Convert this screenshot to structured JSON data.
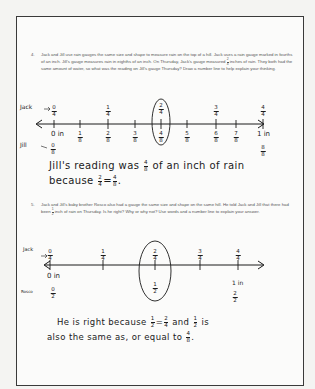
{
  "question4": {
    "number": "4.",
    "text_before_fraction": "Jack and Jill use rain gauges the same size and shape to measure rain on the top of a hill. Jack uses a rain gauge marked in fourths of an inch. Jill's gauge measures rain in eighths of an inch. On Thursday, Jack's gauge measured",
    "fraction": {
      "num": "2",
      "den": "4"
    },
    "text_after_fraction": "inches of rain. They both had the same amount of water, so what was the reading on Jill's gauge Thursday? Draw a number line to help explain your thinking.",
    "number_line": {
      "top_label": "Jack",
      "bottom_label": "Jill",
      "top_ticks": [
        {
          "num": "0",
          "den": "4"
        },
        {
          "num": "1",
          "den": "4"
        },
        {
          "num": "2",
          "den": "4"
        },
        {
          "num": "3",
          "den": "4"
        },
        {
          "num": "4",
          "den": "4"
        }
      ],
      "bottom_ticks": [
        {
          "num": "1",
          "den": "8"
        },
        {
          "num": "2",
          "den": "8"
        },
        {
          "num": "3",
          "den": "8"
        },
        {
          "num": "4",
          "den": "8"
        },
        {
          "num": "5",
          "den": "8"
        },
        {
          "num": "6",
          "den": "8"
        },
        {
          "num": "7",
          "den": "8"
        }
      ],
      "start_label": "0 in",
      "end_label": "1 in",
      "jill_start": {
        "num": "0",
        "den": "8"
      },
      "jill_end": {
        "num": "8",
        "den": "8"
      },
      "circled": "2/4 = 4/8"
    },
    "answer_line1_before": "Jill's reading was",
    "answer_fraction": {
      "num": "4",
      "den": "8"
    },
    "answer_line1_after": "of an inch of rain",
    "answer_line2_before": "because",
    "answer_eq_left": {
      "num": "2",
      "den": "4"
    },
    "answer_eq_sign": "=",
    "answer_eq_right": {
      "num": "4",
      "den": "8"
    },
    "answer_line2_end": "."
  },
  "question5": {
    "number": "5.",
    "text_before_fraction": "Jack and Jill's baby brother Rosco also had a gauge the same size and shape on the same hill. He told Jack and Jill that there had been",
    "fraction": {
      "num": "1",
      "den": "2"
    },
    "text_after_fraction": "inch of rain on Thursday. Is he right? Why or why not? Use words and a number line to explain your answer.",
    "number_line": {
      "top_label": "Jack",
      "bottom_label": "Rosco",
      "top_ticks": [
        {
          "num": "0",
          "den": "4"
        },
        {
          "num": "1",
          "den": "4"
        },
        {
          "num": "2",
          "den": "4"
        },
        {
          "num": "3",
          "den": "4"
        },
        {
          "num": "4",
          "den": "4"
        }
      ],
      "start_label": "0 in",
      "end_label": "1 in",
      "rosco_start": {
        "num": "0",
        "den": "2"
      },
      "rosco_mid": {
        "num": "1",
        "den": "2"
      },
      "rosco_end": {
        "num": "2",
        "den": "2"
      }
    },
    "answer_line1_a": "He is right because",
    "answer_f1": {
      "num": "1",
      "den": "2"
    },
    "answer_eq": "=",
    "answer_f2": {
      "num": "2",
      "den": "4"
    },
    "answer_line1_b": "and",
    "answer_f3": {
      "num": "1",
      "den": "2"
    },
    "answer_line1_c": "is",
    "answer_line2": "also the same as, or equal to",
    "answer_f4": {
      "num": "4",
      "den": "8"
    },
    "answer_line2_end": "."
  }
}
